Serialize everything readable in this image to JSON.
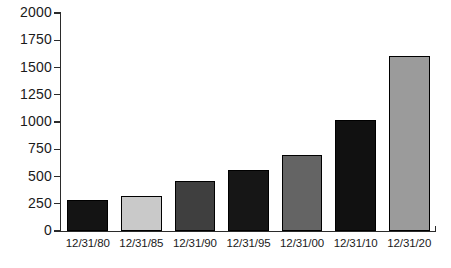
{
  "chart_data": {
    "type": "bar",
    "title": "",
    "subtitle": "",
    "xlabel": "",
    "ylabel": "",
    "categories": [
      "12/31/80",
      "12/31/85",
      "12/31/90",
      "12/31/95",
      "12/31/00",
      "12/31/10",
      "12/31/20"
    ],
    "values": [
      285,
      320,
      460,
      560,
      700,
      1020,
      1610
    ],
    "bar_colors": [
      "#141414",
      "#c9c9c9",
      "#3f3f3f",
      "#161616",
      "#646464",
      "#111111",
      "#9b9b9b"
    ],
    "bar_outline_color": "#000000",
    "ylim": [
      0,
      2000
    ],
    "y_ticks": [
      0,
      250,
      500,
      750,
      1000,
      1250,
      1500,
      1750,
      2000
    ],
    "y_tick_labels": [
      "0",
      "250",
      "500",
      "750",
      "1000",
      "1250",
      "1500",
      "1750",
      "2000"
    ],
    "grid": false,
    "legend": null,
    "legend_position": "none",
    "axis_color": "#2b2b2b",
    "background_color": "#ffffff"
  }
}
